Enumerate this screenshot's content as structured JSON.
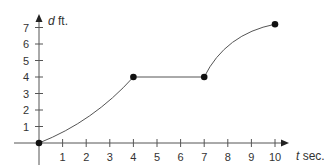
{
  "chart_data": {
    "type": "line",
    "title": "",
    "xlabel": "t sec.",
    "ylabel": "d ft.",
    "xlabel_var": "t",
    "xlabel_unit": "sec.",
    "ylabel_var": "d",
    "ylabel_unit": "ft.",
    "x_ticks": [
      1,
      2,
      3,
      4,
      5,
      6,
      7,
      8,
      9,
      10
    ],
    "y_ticks": [
      1,
      2,
      3,
      4,
      5,
      6,
      7
    ],
    "xlim": [
      0,
      10.8
    ],
    "ylim": [
      0,
      7.7
    ],
    "grid": false,
    "legend": "none",
    "series": [
      {
        "name": "distance",
        "segments": [
          {
            "shape": "concave-up curve",
            "from": [
              0,
              0
            ],
            "to": [
              4,
              4
            ]
          },
          {
            "shape": "horizontal line",
            "from": [
              4,
              4
            ],
            "to": [
              7,
              4
            ]
          },
          {
            "shape": "concave-down curve",
            "from": [
              7,
              4
            ],
            "to": [
              10,
              7.2
            ]
          }
        ],
        "marked_points": [
          [
            0,
            0
          ],
          [
            4,
            4
          ],
          [
            7,
            4
          ],
          [
            10,
            7.2
          ]
        ]
      }
    ]
  }
}
